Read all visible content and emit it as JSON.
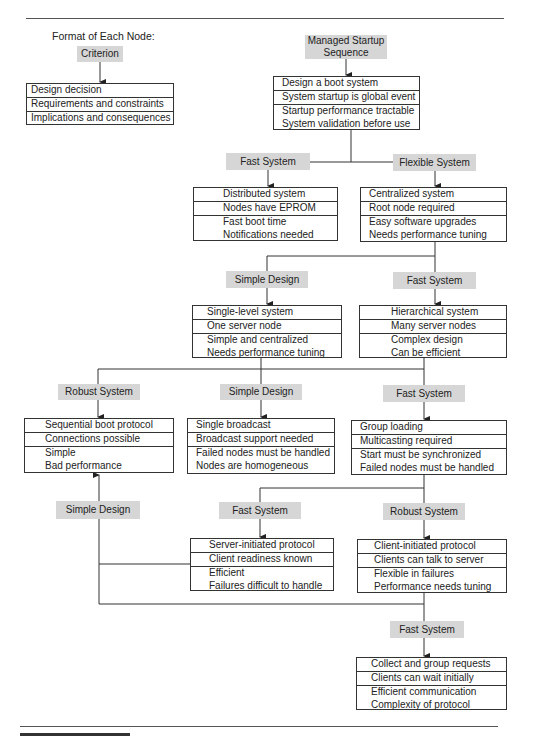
{
  "legend": {
    "title": "Format of Each Node:",
    "criterion_label": "Criterion",
    "rows": [
      "Design decision",
      "Requirements and constraints",
      "Implications and consequences"
    ]
  },
  "root": {
    "label": "Managed Startup Sequence",
    "label_lines": [
      "Managed Startup",
      "Sequence"
    ],
    "decision": "Design a boot system",
    "requirements": "System startup is global event",
    "implications": [
      "Startup performance tractable",
      "System validation before use"
    ]
  },
  "nodes": {
    "distributed": {
      "criterion": "Fast System",
      "decision": "Distributed system",
      "requirements": "Nodes have EPROM",
      "implications": [
        "Fast boot time",
        "Notifications needed"
      ]
    },
    "centralized": {
      "criterion": "Flexible System",
      "decision": "Centralized system",
      "requirements": "Root node required",
      "implications": [
        "Easy software upgrades",
        "Needs performance tuning"
      ]
    },
    "single_level": {
      "criterion": "Simple Design",
      "decision": "Single-level system",
      "requirements": "One server node",
      "implications": [
        "Simple and centralized",
        "Needs performance tuning"
      ]
    },
    "hierarchical": {
      "criterion": "Fast System",
      "decision": "Hierarchical system",
      "requirements": "Many server nodes",
      "implications": [
        "Complex design",
        "Can be efficient"
      ]
    },
    "sequential": {
      "criterion": "Robust System",
      "decision": "Sequential boot protocol",
      "requirements": "Connections possible",
      "implications": [
        "Simple",
        "Bad performance"
      ]
    },
    "broadcast": {
      "criterion": "Simple Design",
      "decision": "Single broadcast",
      "requirements": "Broadcast support needed",
      "implications": [
        "Failed nodes must be handled",
        "Nodes are homogeneous"
      ]
    },
    "group_loading": {
      "criterion": "Fast System",
      "decision": "Group loading",
      "requirements": "Multicasting required",
      "implications": [
        "Start must be synchronized",
        "Failed nodes must be handled"
      ]
    },
    "server_initiated": {
      "criterion": "Fast System",
      "decision": "Server-initiated protocol",
      "requirements": "Client readiness known",
      "implications": [
        "Efficient",
        "Failures difficult to handle"
      ]
    },
    "client_initiated": {
      "criterion": "Robust System",
      "decision": "Client-initiated protocol",
      "requirements": "Clients can talk to server",
      "implications": [
        "Flexible in failures",
        "Performance needs tuning"
      ]
    },
    "collect_group": {
      "criterion": "Fast System",
      "decision": "Collect and group requests",
      "requirements": "Clients can wait initially",
      "implications": [
        "Efficient communication",
        "Complexity of protocol"
      ]
    }
  },
  "back_edge": {
    "criterion": "Simple Design",
    "from": "server_initiated / client_initiated",
    "to": "sequential"
  },
  "colors": {
    "criterion_fill": "#d6d6d6",
    "line": "#333333",
    "background": "#ffffff"
  }
}
